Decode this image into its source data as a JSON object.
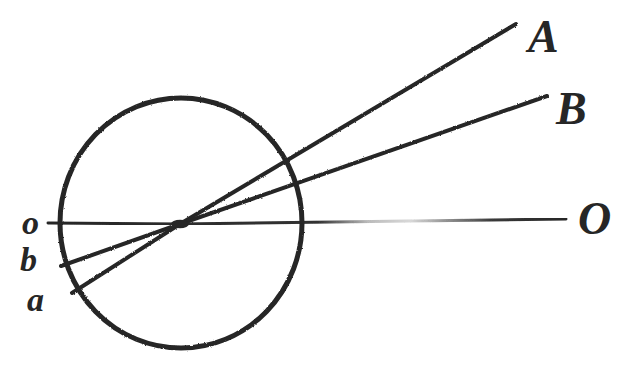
{
  "figure": {
    "background_color": "#ffffff",
    "ink_color": "#262626",
    "width": 624,
    "height": 372
  },
  "labels": {
    "object_a": "a",
    "object_b": "b",
    "axis_left": "o",
    "axis_right": "O",
    "ray_a_source": "A",
    "ray_b_source": "B"
  },
  "elements": {
    "circle_name": "eyeball-circle",
    "nodal_point_name": "nodal-point",
    "optical_axis_name": "optical-axis",
    "ray_a_name": "ray-A-to-a",
    "ray_b_name": "ray-B-to-b"
  },
  "chart_data": {
    "type": "diagram",
    "circle": {
      "label": "eyeball-circle",
      "center_x": 181,
      "center_y": 223,
      "radius_x": 121,
      "radius_y": 125,
      "stroke_width": 5
    },
    "nodal_point": {
      "label": "nodal-point",
      "x": 180,
      "y": 224
    },
    "rays": [
      {
        "name": "optical-axis",
        "from_label": "o",
        "to_label": "O",
        "from_x": 48,
        "from_y": 223,
        "to_x": 566,
        "to_y": 219,
        "through_nodal_point": true,
        "style": "faint-broken",
        "stroke_width": 3
      },
      {
        "name": "ray-A-to-a",
        "from_label": "A",
        "to_label": "a",
        "from_x": 516,
        "from_y": 24,
        "to_x": 72,
        "to_y": 293,
        "through_nodal_point": true,
        "circle_entry_x": 283,
        "circle_entry_y": 160,
        "style": "solid",
        "stroke_width": 4
      },
      {
        "name": "ray-B-to-b",
        "from_label": "B",
        "to_label": "b",
        "from_x": 547,
        "from_y": 96,
        "to_x": 61,
        "to_y": 266,
        "through_nodal_point": true,
        "circle_entry_x": 291,
        "circle_entry_y": 190,
        "style": "solid",
        "stroke_width": 4
      }
    ],
    "label_positions": [
      {
        "text": "A",
        "x": 528,
        "y": 14,
        "size": 46
      },
      {
        "text": "B",
        "x": 556,
        "y": 86,
        "size": 46
      },
      {
        "text": "O",
        "x": 578,
        "y": 196,
        "size": 46
      },
      {
        "text": "o",
        "x": 22,
        "y": 206,
        "size": 34
      },
      {
        "text": "b",
        "x": 20,
        "y": 243,
        "size": 34
      },
      {
        "text": "a",
        "x": 27,
        "y": 283,
        "size": 34
      }
    ],
    "xlabel": "",
    "ylabel": "",
    "grid": false,
    "legend": "none"
  }
}
